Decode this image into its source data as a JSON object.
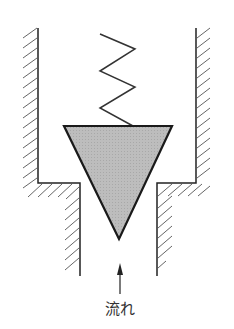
{
  "diagram": {
    "type": "valve schematic",
    "flow_label": "流れ",
    "colors": {
      "stroke": "#222222",
      "hatch": "#555555",
      "valve_fill": "#b8b8b8",
      "background": "#ffffff"
    },
    "elements": {
      "spring": "compression spring above valve",
      "valve": "inverted triangular (conical) valve plug, gray fill",
      "housing": "hatched walls with stepped narrowing at bottom",
      "arrow": "upward arrow indicating flow direction"
    }
  }
}
